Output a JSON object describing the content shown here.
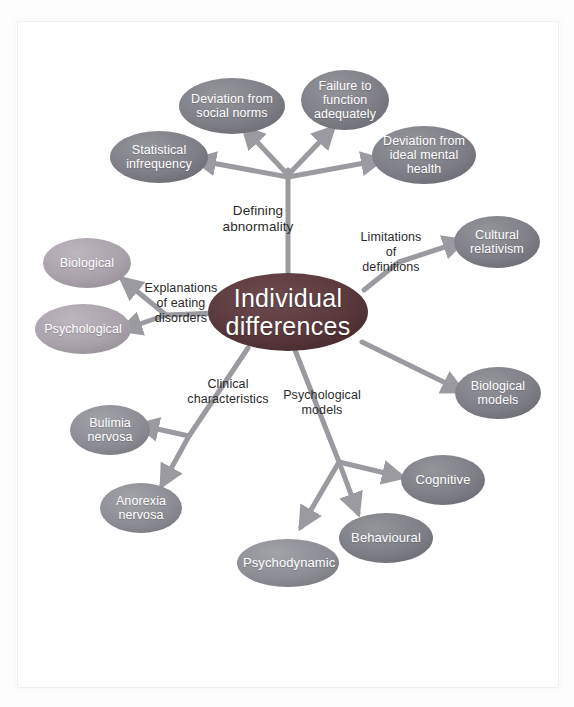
{
  "diagram": {
    "title": "Individual differences",
    "type": "mind-map",
    "colors": {
      "center_fill": "#5c3b3f",
      "node_dark": "#7f7f86",
      "node_medium": "#8e8e95",
      "node_light": "#a9a2aa",
      "connector": "#9a9aa0",
      "label_text": "#2a2a2a",
      "node_text": "#ffffff",
      "background": "#ffffff"
    },
    "center": {
      "line1": "Individual",
      "line2": "differences"
    },
    "branch_labels": [
      {
        "id": "defining-abnormality",
        "line1": "Defining",
        "line2": "abnormality"
      },
      {
        "id": "limitations-of-definitions",
        "line1": "Limitations",
        "line2": "of",
        "line3": "definitions"
      },
      {
        "id": "explanations-of-eating-disorders",
        "line1": "Explanations",
        "line2": "of eating",
        "line3": "disorders"
      },
      {
        "id": "clinical-characteristics",
        "line1": "Clinical",
        "line2": "characteristics"
      },
      {
        "id": "psychological-models",
        "line1": "Psychological",
        "line2": "models"
      }
    ],
    "nodes": [
      {
        "id": "deviation-from-social-norms",
        "line1": "Deviation from",
        "line2": "social norms",
        "shade": "node_dark"
      },
      {
        "id": "failure-to-function-adequately",
        "line1": "Failure to",
        "line2": "function",
        "line3": "adequately",
        "shade": "node_dark"
      },
      {
        "id": "statistical-infrequency",
        "line1": "Statistical",
        "line2": "infrequency",
        "shade": "node_dark"
      },
      {
        "id": "deviation-from-ideal-mental-health",
        "line1": "Deviation from",
        "line2": "ideal mental",
        "line3": "health",
        "shade": "node_dark"
      },
      {
        "id": "cultural-relativism",
        "line1": "Cultural",
        "line2": "relativism",
        "shade": "node_dark"
      },
      {
        "id": "biological-models",
        "line1": "Biological",
        "line2": "models",
        "shade": "node_dark"
      },
      {
        "id": "biological",
        "line1": "Biological",
        "shade": "node_light"
      },
      {
        "id": "psychological",
        "line1": "Psychological",
        "shade": "node_light"
      },
      {
        "id": "bulimia-nervosa",
        "line1": "Bulimia",
        "line2": "nervosa",
        "shade": "node_medium"
      },
      {
        "id": "anorexia-nervosa",
        "line1": "Anorexia",
        "line2": "nervosa",
        "shade": "node_medium"
      },
      {
        "id": "cognitive",
        "line1": "Cognitive",
        "shade": "node_dark"
      },
      {
        "id": "behavioural",
        "line1": "Behavioural",
        "shade": "node_dark"
      },
      {
        "id": "psychodynamic",
        "line1": "Psychodynamic",
        "shade": "node_medium"
      }
    ]
  }
}
